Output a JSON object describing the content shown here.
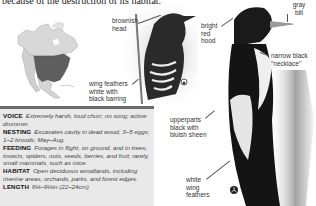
{
  "intro_text": "because of the destruction of its habitat.",
  "map": {
    "label": "North America range map",
    "range_color": "#555555",
    "land_color": "#dcdcdc"
  },
  "callouts": {
    "brownish_head": "brownish head",
    "wing_feathers": "wing feathers white with black barring",
    "bright_red_hood": "bright red hood",
    "gray_bill": "gray bill",
    "narrow_black_necklace": "narrow black \"necklace\"",
    "upperparts": "upperparts black with bluish sheen",
    "white_wing_feathers": "white wing feathers"
  },
  "facts": [
    {
      "label": "VOICE",
      "value": "Extremely harsh, loud churr; no song; active drummer."
    },
    {
      "label": "NESTING",
      "value": "Excavates cavity in dead wood; 3–5 eggs; 1–2 broods; May–Aug."
    },
    {
      "label": "FEEDING",
      "value": "Forages in flight, on ground, and in trees; insects, spiders, nuts, seeds, berries, and fruit; rarely, small mammals, such as mice."
    },
    {
      "label": "HABITAT",
      "value": "Open deciduous woodlands, including riverine areas, orchards, parks, and forest edges."
    },
    {
      "label": "LENGTH",
      "value": "8¼–9¼in (22–24cm)"
    }
  ],
  "colors": {
    "facts_background": "#e9e9e9",
    "facts_border": "#6a6a6a"
  }
}
